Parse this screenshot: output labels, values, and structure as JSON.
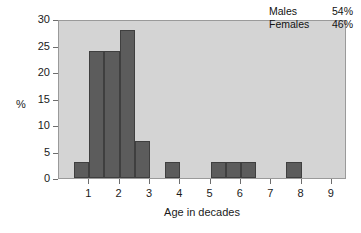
{
  "chart_data": {
    "type": "bar",
    "title": "",
    "subtitle": "",
    "xlabel": "Age in decades",
    "ylabel": "%",
    "xlim": [
      0,
      9.5
    ],
    "ylim": [
      0,
      30
    ],
    "grid": false,
    "legend_position": "top-right",
    "xticks": [
      "1",
      "2",
      "3",
      "4",
      "5",
      "6",
      "7",
      "8",
      "9"
    ],
    "xtick_values": [
      1,
      2,
      3,
      4,
      5,
      6,
      7,
      8,
      9
    ],
    "yticks": [
      "0",
      "5",
      "10",
      "15",
      "20",
      "25",
      "30"
    ],
    "ytick_values": [
      0,
      5,
      10,
      15,
      20,
      25,
      30
    ],
    "bin_width": 0.5,
    "bars": [
      {
        "x_start": 0.5,
        "x_end": 1.0,
        "value": 3
      },
      {
        "x_start": 1.0,
        "x_end": 1.5,
        "value": 24
      },
      {
        "x_start": 1.5,
        "x_end": 2.0,
        "value": 24
      },
      {
        "x_start": 2.0,
        "x_end": 2.5,
        "value": 28
      },
      {
        "x_start": 2.5,
        "x_end": 3.0,
        "value": 7
      },
      {
        "x_start": 3.5,
        "x_end": 4.0,
        "value": 3
      },
      {
        "x_start": 5.0,
        "x_end": 5.5,
        "value": 3
      },
      {
        "x_start": 5.5,
        "x_end": 6.0,
        "value": 3
      },
      {
        "x_start": 6.0,
        "x_end": 6.5,
        "value": 3
      },
      {
        "x_start": 7.5,
        "x_end": 8.0,
        "value": 3
      }
    ],
    "categories": [
      "0.5-1",
      "1-1.5",
      "1.5-2",
      "2-2.5",
      "2.5-3",
      "3.5-4",
      "5-5.5",
      "5.5-6",
      "6-6.5",
      "7.5-8"
    ],
    "values": [
      3,
      24,
      24,
      28,
      7,
      3,
      3,
      3,
      3,
      3
    ],
    "annotations": [
      {
        "label": "Males",
        "value": "54%"
      },
      {
        "label": "Females",
        "value": "46%"
      }
    ],
    "colors": {
      "bar_fill": "#5c5c5c",
      "bar_edge": "#3f3f3f",
      "plot_background": "#d4d4d4",
      "frame": "#9a9a9a",
      "text": "#1a1a1a",
      "page_background": "#ffffff"
    }
  },
  "legend": {
    "rows": [
      {
        "name": "Males",
        "value": "54%"
      },
      {
        "name": "Females",
        "value": "46%"
      }
    ]
  }
}
